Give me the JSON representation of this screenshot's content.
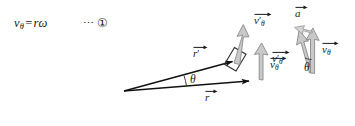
{
  "figure": {
    "caption_formula": {
      "v_symbol": "v",
      "v_subscript": "θ",
      "equals": "=",
      "rhs": "rω",
      "dots": "⋯",
      "equation_number": "①"
    },
    "labels": {
      "r_prime": {
        "base": "r",
        "prime": "′",
        "sub": ""
      },
      "r": {
        "base": "r",
        "prime": "",
        "sub": ""
      },
      "v_theta_prime_tip": {
        "base": "v",
        "prime": "′",
        "sub": "θ"
      },
      "v_theta_tip": {
        "base": "v",
        "prime": "",
        "sub": "θ"
      },
      "a_vector": {
        "base": "a",
        "prime": "",
        "sub": ""
      },
      "v_theta_prime_cluster": {
        "base": "v",
        "prime": "′",
        "sub": "θ"
      },
      "v_theta_cluster": {
        "base": "v",
        "prime": "",
        "sub": "θ"
      },
      "theta_main": "θ",
      "theta_cluster": "θ"
    },
    "colors": {
      "background": "#ffffff",
      "ink": "#1a1a1a",
      "radius_vector_stroke": "#111111",
      "velocity_arrow_fill": "#c9c9c9",
      "velocity_arrow_stroke": "#8a8a8a",
      "accel_arrow_fill": "#d4d4d4",
      "accel_arrow_stroke": "#9a9a9a",
      "right_angle_stroke": "#2b2b2b"
    },
    "geometry": {
      "origin": [
        124,
        91
      ],
      "r_prime_tip": [
        238,
        60
      ],
      "r_tip": [
        253,
        80
      ],
      "angle_theta_degrees": 9
    }
  }
}
